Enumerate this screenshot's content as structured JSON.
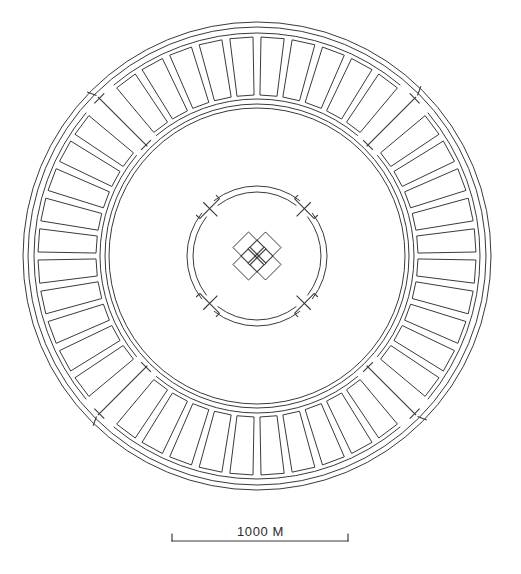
{
  "drawing": {
    "kind": "architectural-site-plan",
    "title_visible": false,
    "line_color": "#3a3a3a",
    "fill_color": "none",
    "background_color": "#ffffff"
  },
  "scale_bar": {
    "label": "1000 M",
    "distance_value": "1000",
    "unit": "M",
    "bar_left_x": 172,
    "bar_right_x": 348,
    "bar_y": 541,
    "tick_height": 7
  },
  "geometry": {
    "center_x": 257,
    "center_y": 256,
    "outer_ring": {
      "circles_r": [
        234,
        229
      ],
      "segment_band_outer_r": 223,
      "segment_band_inner_r": 157,
      "segment_inset": 4,
      "segment_count": 44,
      "bracket_angles_deg": [
        45,
        135,
        225,
        315
      ],
      "bracket_gap_deg": 5
    },
    "mid_circles_r": [
      152,
      148
    ],
    "inner_ring": {
      "circles_r": [
        70,
        64
      ],
      "bracket_angles_deg": [
        45,
        135,
        225,
        315
      ],
      "bracket_arm_len": 14,
      "bracket_gap_deg": 7
    },
    "core_cluster": {
      "rotation_deg": 45,
      "outer_square_size": 22,
      "outer_square_offset": 12,
      "inner_square_size": 13,
      "inner_square_offset": 7,
      "petal_count": 4
    }
  }
}
